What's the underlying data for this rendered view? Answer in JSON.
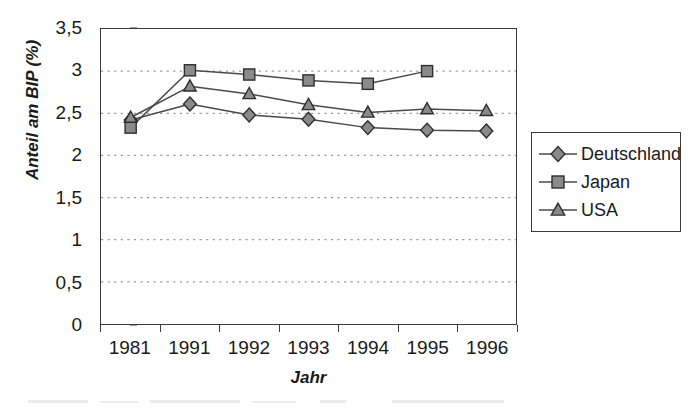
{
  "chart_data": {
    "type": "line",
    "title": "",
    "xlabel": "Jahr",
    "ylabel": "Anteil am BIP (%)",
    "categories": [
      "1981",
      "1991",
      "1992",
      "1993",
      "1994",
      "1995",
      "1996"
    ],
    "ylim": [
      0,
      3.5
    ],
    "ytick_labels": [
      "0",
      "0,5",
      "1",
      "1,5",
      "2",
      "2,5",
      "3",
      "3,5"
    ],
    "ytick_values": [
      0,
      0.5,
      1,
      1.5,
      2,
      2.5,
      3,
      3.5
    ],
    "grid": "horizontal-dotted",
    "legend_position": "right",
    "decimal_separator": ",",
    "series": [
      {
        "name": "Deutschland",
        "marker": "diamond",
        "values": [
          2.42,
          2.61,
          2.48,
          2.43,
          2.33,
          2.3,
          2.29
        ]
      },
      {
        "name": "Japan",
        "marker": "square",
        "values": [
          2.33,
          3.01,
          2.96,
          2.89,
          2.85,
          3.0,
          null
        ]
      },
      {
        "name": "USA",
        "marker": "triangle",
        "values": [
          2.45,
          2.82,
          2.73,
          2.6,
          2.51,
          2.55,
          2.53
        ]
      }
    ]
  },
  "style": {
    "line_color": "#4a4a4a",
    "marker_fill": "#8a8a8a",
    "marker_stroke": "#2e2e2e",
    "axis_color": "#3b3b3b",
    "grid_color": "#9a9a9a",
    "background": "#ffffff"
  },
  "legend": {
    "items": [
      {
        "label": "Deutschland",
        "marker": "diamond"
      },
      {
        "label": "Japan",
        "marker": "square"
      },
      {
        "label": "USA",
        "marker": "triangle"
      }
    ]
  }
}
